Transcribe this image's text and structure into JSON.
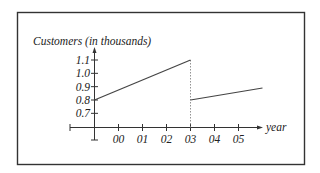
{
  "chart_data": {
    "type": "line",
    "title": "",
    "ylabel": "Customers (in thousands)",
    "xlabel": "year",
    "y_ticks": [
      "0.7",
      "0.8",
      "0.9",
      "1.0",
      "1.1"
    ],
    "y_tick_values": [
      0.7,
      0.8,
      0.9,
      1.0,
      1.1
    ],
    "x_ticks": [
      "00",
      "01",
      "02",
      "03",
      "04",
      "05"
    ],
    "x_tick_values": [
      0,
      1,
      2,
      3,
      4,
      5
    ],
    "ylim": [
      0.6,
      1.2
    ],
    "xlim": [
      -1,
      6
    ],
    "grid": false,
    "legend": null,
    "series": [
      {
        "name": "segment 1",
        "x": [
          -1,
          3
        ],
        "y": [
          0.8,
          1.1
        ]
      },
      {
        "name": "segment 2",
        "x": [
          3,
          6
        ],
        "y": [
          0.8,
          0.89
        ]
      }
    ],
    "annotations": [
      {
        "type": "dotted-vertical-line",
        "x": 3,
        "from_y": 0.6,
        "to_y": 1.1,
        "note": "discontinuity at year 03"
      }
    ]
  }
}
